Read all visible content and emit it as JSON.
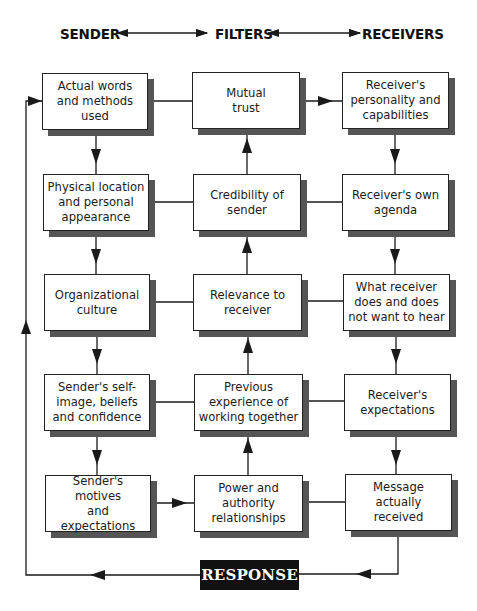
{
  "header": {
    "sender": "SENDER",
    "filters": "FILTERS",
    "receivers": "RECEIVERS"
  },
  "columns": {
    "sender": [
      "Actual words\nand methods\nused",
      "Physical location\nand personal\nappearance",
      "Organizational\nculture",
      "Sender's self-\nimage, beliefs\nand confidence",
      "Sender's motives\nand\nexpectations"
    ],
    "filters": [
      "Mutual\ntrust",
      "Credibility of\nsender",
      "Relevance to\nreceiver",
      "Previous\nexperience of\nworking together",
      "Power and\nauthority\nrelationships"
    ],
    "receivers": [
      "Receiver's\npersonality and\ncapabilities",
      "Receiver's own\nagenda",
      "What receiver\ndoes and does\nnot want to hear",
      "Receiver's\nexpectations",
      "Message\nactually\nreceived"
    ]
  },
  "response": {
    "label": "RESPONSE"
  },
  "colors": {
    "line": "#1a1a1a",
    "box_border": "#222222",
    "box_shadow": "#555555",
    "response_bg": "#111111",
    "response_text": "#ffffff"
  }
}
